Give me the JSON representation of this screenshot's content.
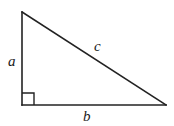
{
  "diagram": {
    "type": "right-triangle",
    "vertices": {
      "top": [
        22,
        12
      ],
      "bottom_left": [
        22,
        105
      ],
      "bottom_right": [
        166,
        105
      ]
    },
    "right_angle_at": "bottom_left",
    "right_angle_marker_size": 12,
    "line_color": "#222222",
    "labels": {
      "a": {
        "text": "a",
        "side": "vertical leg",
        "pos": [
          8,
          66
        ]
      },
      "b": {
        "text": "b",
        "side": "horizontal leg",
        "pos": [
          83,
          121
        ]
      },
      "c": {
        "text": "c",
        "side": "hypotenuse",
        "pos": [
          94,
          51
        ]
      }
    }
  }
}
